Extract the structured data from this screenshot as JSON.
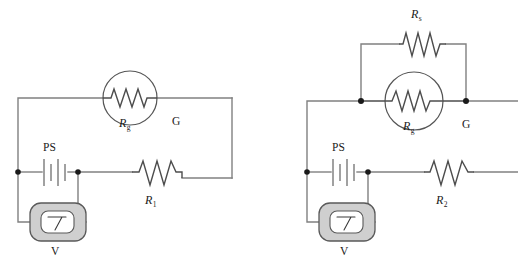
{
  "figure": {
    "type": "circuit-diagram",
    "background_color": "#ffffff",
    "wire_color": "#808080",
    "component_color": "#4d4d4d",
    "node_color": "#1a1a1a",
    "meter_body_color": "#cfcfcf"
  },
  "circuits": [
    {
      "id": "left-circuit",
      "name": "galvanometer-with-series-resistor",
      "components": {
        "galvanometer": {
          "symbol_label": "G",
          "internal_resistance_label": "R",
          "internal_resistance_subscript": "g"
        },
        "power_supply": {
          "label": "PS",
          "type": "battery"
        },
        "voltmeter": {
          "label": "V",
          "type": "panel-meter"
        },
        "resistor": {
          "label": "R",
          "subscript": "1"
        }
      }
    },
    {
      "id": "right-circuit",
      "name": "galvanometer-with-shunt-and-series-resistor",
      "components": {
        "shunt_resistor": {
          "label": "R",
          "subscript": "s"
        },
        "galvanometer": {
          "symbol_label": "G",
          "internal_resistance_label": "R",
          "internal_resistance_subscript": "g"
        },
        "power_supply": {
          "label": "PS",
          "type": "battery"
        },
        "voltmeter": {
          "label": "V",
          "type": "panel-meter"
        },
        "resistor": {
          "label": "R",
          "subscript": "2"
        }
      }
    }
  ],
  "labels": {
    "left": {
      "g_symbol": "G",
      "rg_main": "R",
      "rg_sub": "g",
      "ps": "PS",
      "v": "V",
      "r1_main": "R",
      "r1_sub": "1"
    },
    "right": {
      "rs_main": "R",
      "rs_sub": "s",
      "g_symbol": "G",
      "rg_main": "R",
      "rg_sub": "g",
      "ps": "PS",
      "v": "V",
      "r2_main": "R",
      "r2_sub": "2"
    }
  }
}
